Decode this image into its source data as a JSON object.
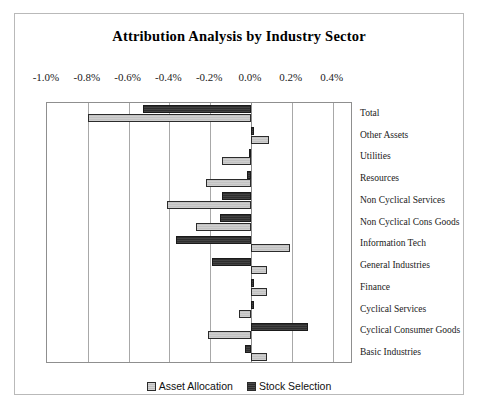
{
  "chart_data": {
    "type": "bar",
    "orientation": "horizontal",
    "title": "Attribution Analysis by Industry Sector",
    "xlabel": "",
    "ylabel": "",
    "xlim": [
      -1.0,
      0.5
    ],
    "xtick_labels": [
      "-1.0%",
      "-0.8%",
      "-0.6%",
      "-0.4%",
      "-0.2%",
      "0.0%",
      "0.2%",
      "0.4%"
    ],
    "xticks": [
      -1.0,
      -0.8,
      -0.6,
      -0.4,
      -0.2,
      0.0,
      0.2,
      0.4
    ],
    "grid": true,
    "legend_position": "bottom",
    "categories": [
      "Total",
      "Other Assets",
      "Utilities",
      "Resources",
      "Non Cyclical Services",
      "Non Cyclical Cons Goods",
      "Information Tech",
      "General Industries",
      "Finance",
      "Cyclical Services",
      "Cyclical Consumer Goods",
      "Basic Industries"
    ],
    "series": [
      {
        "name": "Asset Allocation",
        "color": "#c9c9c9",
        "values": [
          -0.8,
          0.09,
          -0.14,
          -0.22,
          -0.41,
          -0.27,
          0.19,
          0.08,
          0.08,
          -0.06,
          -0.21,
          0.08
        ]
      },
      {
        "name": "Stock Selection",
        "color": "#3a3a3a",
        "values": [
          -0.53,
          0.0,
          -0.01,
          -0.02,
          -0.14,
          -0.15,
          -0.37,
          -0.19,
          0.0,
          0.01,
          0.28,
          -0.03
        ]
      }
    ]
  },
  "legend": {
    "entries": [
      {
        "label": "Asset Allocation",
        "swatch": "alloc"
      },
      {
        "label": "Stock Selection",
        "swatch": "sel"
      }
    ]
  }
}
